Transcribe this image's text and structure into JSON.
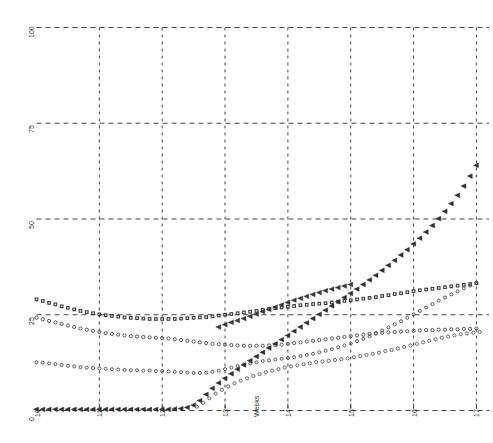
{
  "chart_data": {
    "type": "scatter",
    "title": "",
    "subtitle": "",
    "xlabel": "Weeks",
    "ylabel": "",
    "xlim": [
      10,
      17.2
    ],
    "ylim": [
      0,
      100
    ],
    "xticks": [
      10,
      11,
      12,
      13,
      14,
      15,
      16,
      17
    ],
    "xticklabels": [
      "10",
      "11",
      "12",
      "13",
      "14",
      "15",
      "16",
      "17"
    ],
    "yticks": [
      0,
      25,
      50,
      75,
      100
    ],
    "yticklabels": [
      "0",
      "25",
      "50",
      "75",
      "100"
    ],
    "grid": true,
    "grid_style": "dashed",
    "grid_color": "#444444",
    "legend": "none",
    "series": [
      {
        "name": "series-squares",
        "marker": "square",
        "color": "#3a3a3a",
        "x": [
          10.0,
          10.1,
          10.2,
          10.3,
          10.4,
          10.5,
          10.6,
          10.7,
          10.8,
          10.9,
          11.0,
          11.1,
          11.2,
          11.3,
          11.4,
          11.5,
          11.6,
          11.7,
          11.8,
          11.9,
          12.0,
          12.1,
          12.2,
          12.3,
          12.4,
          12.5,
          12.6,
          12.7,
          12.8,
          12.9,
          13.0,
          13.1,
          13.2,
          13.3,
          13.4,
          13.5,
          13.6,
          13.7,
          13.8,
          13.9,
          14.0,
          14.1,
          14.2,
          14.3,
          14.4,
          14.5,
          14.6,
          14.7,
          14.8,
          14.9,
          15.0,
          15.1,
          15.2,
          15.3,
          15.4,
          15.5,
          15.6,
          15.7,
          15.8,
          15.9,
          16.0,
          16.1,
          16.2,
          16.3,
          16.4,
          16.5,
          16.6,
          16.7,
          16.8,
          16.9,
          17.0
        ],
        "y": [
          29.0,
          28.6,
          28.1,
          27.7,
          27.2,
          26.8,
          26.4,
          26.0,
          25.7,
          25.4,
          25.1,
          24.9,
          24.7,
          24.5,
          24.3,
          24.2,
          24.1,
          24.0,
          23.9,
          23.9,
          23.9,
          23.9,
          23.9,
          24.0,
          24.1,
          24.2,
          24.3,
          24.4,
          24.6,
          24.8,
          25.0,
          25.2,
          25.4,
          25.6,
          25.8,
          26.0,
          26.3,
          26.5,
          26.7,
          26.9,
          27.1,
          27.3,
          27.5,
          27.6,
          27.8,
          27.9,
          28.0,
          28.2,
          28.4,
          28.6,
          28.8,
          29.0,
          29.2,
          29.4,
          29.6,
          29.9,
          30.1,
          30.4,
          30.6,
          30.9,
          31.2,
          31.4,
          31.6,
          31.8,
          32.0,
          32.2,
          32.4,
          32.6,
          32.8,
          33.0,
          33.2
        ]
      },
      {
        "name": "series-circles-upper",
        "marker": "circle",
        "color": "#555555",
        "x": [
          10.0,
          10.1,
          10.2,
          10.3,
          10.4,
          10.5,
          10.6,
          10.7,
          10.8,
          10.9,
          11.0,
          11.1,
          11.2,
          11.3,
          11.4,
          11.5,
          11.6,
          11.7,
          11.8,
          11.9,
          12.0,
          12.1,
          12.2,
          12.3,
          12.4,
          12.5,
          12.6,
          12.7,
          12.8,
          12.9,
          13.0,
          13.1,
          13.2,
          13.3,
          13.4,
          13.5,
          13.6,
          13.7,
          13.8,
          13.9,
          14.0,
          14.1,
          14.2,
          14.3,
          14.4,
          14.5,
          14.6,
          14.7,
          14.8,
          14.9,
          15.0,
          15.1,
          15.2,
          15.3,
          15.4,
          15.5,
          15.6,
          15.7,
          15.8,
          15.9,
          16.0,
          16.1,
          16.2,
          16.3,
          16.4,
          16.5,
          16.6,
          16.7,
          16.8,
          16.9,
          17.0
        ],
        "y": [
          24.2,
          23.8,
          23.4,
          23.0,
          22.6,
          22.2,
          21.8,
          21.4,
          21.1,
          20.8,
          20.5,
          20.2,
          20.0,
          19.8,
          19.6,
          19.4,
          19.3,
          19.2,
          19.1,
          19.0,
          18.9,
          18.8,
          18.6,
          18.4,
          18.2,
          18.0,
          17.8,
          17.6,
          17.4,
          17.3,
          17.2,
          17.1,
          17.0,
          16.9,
          16.9,
          16.9,
          16.9,
          17.0,
          17.1,
          17.2,
          17.4,
          17.6,
          17.8,
          18.0,
          18.2,
          18.4,
          18.6,
          18.8,
          19.0,
          19.2,
          19.4,
          19.6,
          19.8,
          20.0,
          20.2,
          20.3,
          20.4,
          20.5,
          20.6,
          20.7,
          20.8,
          20.9,
          21.0,
          21.0,
          21.1,
          21.1,
          21.2,
          21.2,
          21.3,
          21.3,
          21.4
        ]
      },
      {
        "name": "series-s-markers",
        "marker": "s-glyph",
        "color": "#555555",
        "x": [
          10.0,
          10.1,
          10.2,
          10.3,
          10.4,
          10.5,
          10.6,
          10.7,
          10.8,
          10.9,
          11.0,
          11.1,
          11.2,
          11.3,
          11.4,
          11.5,
          11.6,
          11.7,
          11.8,
          11.9,
          12.0,
          12.1,
          12.2,
          12.3,
          12.4,
          12.5,
          12.6,
          12.7,
          12.8,
          12.9,
          13.0,
          13.1,
          13.2,
          13.3,
          13.4,
          13.5,
          13.6,
          13.7,
          13.8,
          13.9,
          14.0,
          14.1,
          14.2,
          14.3,
          14.4,
          14.5,
          14.6,
          14.7,
          14.8,
          14.9,
          15.0,
          15.1,
          15.2,
          15.3,
          15.4,
          15.5,
          15.6,
          15.7,
          15.8,
          15.9,
          16.0,
          16.1,
          16.2,
          16.3,
          16.4,
          16.5,
          16.6,
          16.7,
          16.8,
          16.9,
          17.0
        ],
        "y": [
          12.6,
          12.5,
          12.3,
          12.1,
          11.9,
          11.7,
          11.5,
          11.3,
          11.2,
          11.1,
          11.0,
          10.9,
          10.8,
          10.7,
          10.6,
          10.5,
          10.5,
          10.4,
          10.4,
          10.3,
          10.3,
          10.2,
          10.1,
          10.0,
          9.9,
          9.8,
          9.8,
          9.9,
          10.1,
          10.4,
          10.8,
          11.2,
          11.6,
          12.0,
          12.3,
          12.6,
          12.9,
          13.1,
          13.3,
          13.5,
          13.7,
          13.9,
          14.2,
          14.5,
          14.8,
          15.2,
          15.6,
          16.0,
          16.5,
          17.0,
          17.5,
          18.1,
          18.7,
          19.4,
          20.1,
          20.9,
          21.7,
          22.5,
          23.3,
          24.2,
          25.1,
          26.0,
          26.9,
          27.8,
          28.7,
          29.5,
          30.3,
          31.1,
          31.9,
          32.6,
          33.3
        ]
      },
      {
        "name": "series-triangles",
        "marker": "triangle-left",
        "color": "#2f2f2f",
        "x": [
          10.0,
          10.1,
          10.2,
          10.3,
          10.4,
          10.5,
          10.6,
          10.7,
          10.8,
          10.9,
          11.0,
          11.1,
          11.2,
          11.3,
          11.4,
          11.5,
          11.6,
          11.7,
          11.8,
          11.9,
          12.0,
          12.1,
          12.2,
          12.3,
          12.4,
          12.5,
          12.6,
          12.7,
          12.8,
          12.9,
          13.0,
          13.1,
          13.2,
          13.3,
          13.4,
          13.5,
          13.6,
          13.7,
          13.8,
          13.9,
          14.0,
          14.1,
          14.2,
          14.3,
          14.4,
          14.5,
          14.6,
          14.7,
          14.8,
          14.9,
          15.0,
          15.1,
          15.2,
          15.3,
          15.4,
          15.5,
          15.6,
          15.7,
          15.8,
          15.9,
          16.0,
          16.1,
          16.2,
          16.3,
          16.4,
          16.5,
          16.6,
          16.7,
          16.8,
          16.9,
          17.0
        ],
        "y": [
          0.3,
          0.3,
          0.3,
          0.3,
          0.3,
          0.3,
          0.3,
          0.3,
          0.3,
          0.3,
          0.3,
          0.3,
          0.3,
          0.3,
          0.3,
          0.3,
          0.3,
          0.3,
          0.3,
          0.3,
          0.3,
          0.3,
          0.4,
          0.5,
          0.8,
          1.4,
          2.6,
          4.2,
          5.8,
          7.2,
          8.4,
          9.6,
          10.8,
          11.9,
          13.0,
          14.1,
          15.2,
          16.3,
          17.4,
          18.5,
          19.6,
          20.7,
          21.8,
          22.9,
          24.0,
          25.1,
          26.2,
          27.3,
          28.4,
          29.5,
          30.6,
          31.7,
          32.9,
          34.1,
          35.3,
          36.6,
          37.9,
          39.2,
          40.6,
          42.0,
          43.5,
          45.0,
          46.6,
          48.3,
          50.1,
          52.0,
          54.0,
          56.2,
          58.6,
          61.2,
          64.0
        ]
      },
      {
        "name": "series-circles-lower",
        "marker": "circle",
        "color": "#666666",
        "x": [
          12.55,
          12.65,
          12.75,
          12.85,
          12.95,
          13.05,
          13.15,
          13.25,
          13.35,
          13.45,
          13.55,
          13.65,
          13.75,
          13.85,
          13.95,
          14.05,
          14.15,
          14.25,
          14.35,
          14.45,
          14.55,
          14.65,
          14.75,
          14.85,
          14.95,
          15.05,
          15.15,
          15.25,
          15.35,
          15.45,
          15.55,
          15.65,
          15.75,
          15.85,
          15.95,
          16.05,
          16.15,
          16.25,
          16.35,
          16.45,
          16.55,
          16.65,
          16.75,
          16.85,
          16.95,
          17.05
        ],
        "y": [
          1.0,
          2.0,
          3.2,
          4.4,
          5.4,
          6.3,
          7.1,
          7.8,
          8.4,
          9.0,
          9.5,
          10.0,
          10.4,
          10.8,
          11.2,
          11.5,
          11.8,
          12.1,
          12.3,
          12.6,
          12.8,
          13.0,
          13.2,
          13.4,
          13.6,
          13.9,
          14.2,
          14.5,
          14.8,
          15.1,
          15.5,
          15.8,
          16.2,
          16.6,
          17.0,
          17.4,
          17.8,
          18.2,
          18.6,
          19.0,
          19.3,
          19.6,
          19.9,
          20.1,
          20.3,
          20.5
        ]
      },
      {
        "name": "series-triangles-secondary",
        "marker": "triangle-left",
        "color": "#3a3a3a",
        "x": [
          12.9,
          13.0,
          13.1,
          13.2,
          13.3,
          13.4,
          13.5,
          13.6,
          13.7,
          13.8,
          13.9,
          14.0,
          14.1,
          14.2,
          14.3,
          14.4,
          14.5,
          14.6,
          14.7,
          14.8,
          14.9,
          15.0
        ],
        "y": [
          21.8,
          22.4,
          23.0,
          23.5,
          24.0,
          24.6,
          25.2,
          25.8,
          26.4,
          27.0,
          27.6,
          28.2,
          28.8,
          29.3,
          29.8,
          30.3,
          30.8,
          31.3,
          31.7,
          32.1,
          32.5,
          32.9
        ]
      }
    ]
  },
  "axis": {
    "x_title": "Weeks",
    "y_title": ""
  }
}
